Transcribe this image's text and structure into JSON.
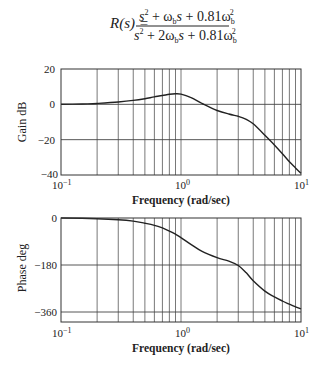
{
  "formula": {
    "lhs": "R(s) =",
    "numerator": [
      "s",
      "2",
      " + ω",
      "b",
      "s + 0.81ω",
      "b",
      "2"
    ],
    "denominator": [
      "s",
      "2",
      " + 2ω",
      "b",
      "s + 0.81ω",
      "b",
      "2"
    ]
  },
  "chart_data": [
    {
      "type": "line",
      "title": "",
      "xlabel": "Frequency (rad/sec)",
      "ylabel": "Gain dB",
      "xscale": "log",
      "xlim": [
        0.1,
        10
      ],
      "ylim": [
        -40,
        20
      ],
      "x_ticks": [
        "10^-1",
        "10^0",
        "10^1"
      ],
      "y_ticks": [
        "20",
        "0",
        "-20",
        "-40"
      ],
      "grid": true,
      "series": [
        {
          "name": "Gain",
          "x": [
            0.1,
            0.15,
            0.2,
            0.3,
            0.4,
            0.5,
            0.6,
            0.7,
            0.8,
            0.9,
            1.0,
            1.2,
            1.5,
            2.0,
            2.5,
            3.0,
            3.5,
            4.0,
            5.0,
            6.0,
            7.0,
            8.0,
            9.0,
            10.0
          ],
          "values": [
            0,
            0.2,
            0.5,
            1.3,
            2.2,
            3.2,
            4.2,
            5.0,
            5.7,
            6.0,
            5.8,
            4.0,
            0.5,
            -3.5,
            -5.5,
            -6.8,
            -8.5,
            -11,
            -17.5,
            -23,
            -28,
            -32.5,
            -36,
            -39
          ]
        }
      ]
    },
    {
      "type": "line",
      "title": "",
      "xlabel": "Frequency (rad/sec)",
      "ylabel": "Phase deg",
      "xscale": "log",
      "xlim": [
        0.1,
        10
      ],
      "ylim": [
        -400,
        0
      ],
      "x_ticks": [
        "10^-1",
        "10^0",
        "10^1"
      ],
      "y_ticks": [
        "0",
        "-180",
        "-360"
      ],
      "grid": true,
      "series": [
        {
          "name": "Phase",
          "x": [
            0.1,
            0.15,
            0.2,
            0.3,
            0.4,
            0.5,
            0.6,
            0.7,
            0.8,
            0.9,
            1.0,
            1.2,
            1.5,
            2.0,
            2.5,
            3.0,
            3.5,
            4.0,
            5.0,
            6.0,
            7.0,
            8.0,
            9.0,
            10.0
          ],
          "values": [
            0,
            -1,
            -3,
            -7,
            -12,
            -20,
            -28,
            -38,
            -50,
            -62,
            -75,
            -100,
            -128,
            -152,
            -165,
            -182,
            -210,
            -240,
            -280,
            -302,
            -318,
            -330,
            -340,
            -348
          ]
        }
      ]
    }
  ],
  "labels": {
    "gain_ylabel": "Gain dB",
    "phase_ylabel": "Phase deg",
    "xlabel": "Frequency (rad/sec)",
    "gain_yticks": [
      "20",
      "0",
      "−20",
      "−40"
    ],
    "phase_yticks": [
      "0",
      "−180",
      "−360"
    ],
    "x_base": "10",
    "x_exps": [
      "−1",
      "0",
      "1"
    ]
  }
}
